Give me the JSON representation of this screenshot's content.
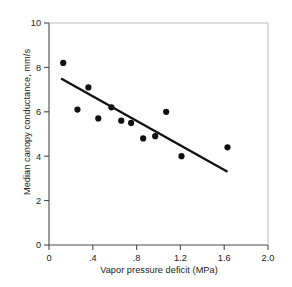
{
  "chart_data": {
    "type": "scatter",
    "title": "",
    "xlabel": "Vapor pressure deficit (MPa)",
    "ylabel": "Median canopy conductance, mm/s",
    "xlim": [
      0,
      2.0
    ],
    "ylim": [
      0,
      10
    ],
    "xticks": [
      0,
      0.4,
      0.8,
      1.2,
      1.6,
      2.0
    ],
    "xticklabels": [
      "0",
      ".4",
      ".8",
      "1.2",
      "1.6",
      "2.0"
    ],
    "yticks": [
      0,
      2,
      4,
      6,
      8,
      10
    ],
    "yticklabels": [
      "0",
      "2",
      "4",
      "6",
      "8",
      "10"
    ],
    "grid": false,
    "legend": "none",
    "marker_color": "#111111",
    "line_color": "#111111",
    "points": [
      {
        "x": 0.13,
        "y": 8.2
      },
      {
        "x": 0.26,
        "y": 6.1
      },
      {
        "x": 0.36,
        "y": 7.1
      },
      {
        "x": 0.45,
        "y": 5.7
      },
      {
        "x": 0.57,
        "y": 6.2
      },
      {
        "x": 0.66,
        "y": 5.6
      },
      {
        "x": 0.75,
        "y": 5.5
      },
      {
        "x": 0.86,
        "y": 4.8
      },
      {
        "x": 0.97,
        "y": 4.9
      },
      {
        "x": 1.07,
        "y": 6.0
      },
      {
        "x": 1.21,
        "y": 4.0
      },
      {
        "x": 1.63,
        "y": 4.4
      }
    ],
    "fit_line": {
      "x1": 0.11,
      "y1": 7.5,
      "x2": 1.63,
      "y2": 3.3
    }
  }
}
